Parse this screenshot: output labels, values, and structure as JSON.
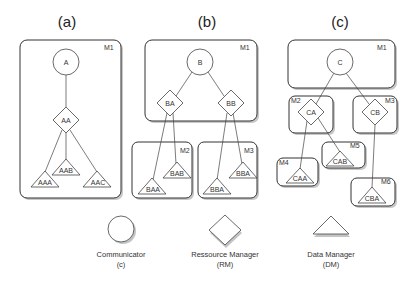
{
  "panels": [
    {
      "id": "a",
      "label": "(a)",
      "machines": [
        {
          "id": "M1",
          "label": "M1"
        }
      ],
      "nodes": [
        {
          "id": "A",
          "type": "communicator",
          "label": "A"
        },
        {
          "id": "AA",
          "type": "resource_manager",
          "label": "AA"
        },
        {
          "id": "AAA",
          "type": "data_manager",
          "label": "AAA"
        },
        {
          "id": "AAB",
          "type": "data_manager",
          "label": "AAB"
        },
        {
          "id": "AAC",
          "type": "data_manager",
          "label": "AAC"
        }
      ],
      "edges": [
        [
          "A",
          "AA"
        ],
        [
          "AA",
          "AAA"
        ],
        [
          "AA",
          "AAB"
        ],
        [
          "AA",
          "AAC"
        ]
      ]
    },
    {
      "id": "b",
      "label": "(b)",
      "machines": [
        {
          "id": "M1",
          "label": "M1"
        },
        {
          "id": "M2",
          "label": "M2"
        },
        {
          "id": "M3",
          "label": "M3"
        }
      ],
      "nodes": [
        {
          "id": "B",
          "type": "communicator",
          "label": "B"
        },
        {
          "id": "BA",
          "type": "resource_manager",
          "label": "BA"
        },
        {
          "id": "BB",
          "type": "resource_manager",
          "label": "BB"
        },
        {
          "id": "BAA",
          "type": "data_manager",
          "label": "BAA"
        },
        {
          "id": "BAB",
          "type": "data_manager",
          "label": "BAB"
        },
        {
          "id": "BBA_1",
          "type": "data_manager",
          "label": "BBA"
        },
        {
          "id": "BBA_2",
          "type": "data_manager",
          "label": "BBA"
        }
      ],
      "edges": [
        [
          "B",
          "BA"
        ],
        [
          "B",
          "BB"
        ],
        [
          "BA",
          "BAA"
        ],
        [
          "BA",
          "BAB"
        ],
        [
          "BB",
          "BBA_1"
        ],
        [
          "BB",
          "BBA_2"
        ]
      ]
    },
    {
      "id": "c",
      "label": "(c)",
      "machines": [
        {
          "id": "M1",
          "label": "M1"
        },
        {
          "id": "M2",
          "label": "M2"
        },
        {
          "id": "M3",
          "label": "M3"
        },
        {
          "id": "M4",
          "label": "M4"
        },
        {
          "id": "M5",
          "label": "M5"
        },
        {
          "id": "M6",
          "label": "M6"
        }
      ],
      "nodes": [
        {
          "id": "C",
          "type": "communicator",
          "label": "C"
        },
        {
          "id": "CA",
          "type": "resource_manager",
          "label": "CA"
        },
        {
          "id": "CB",
          "type": "resource_manager",
          "label": "CB"
        },
        {
          "id": "CAA",
          "type": "data_manager",
          "label": "CAA"
        },
        {
          "id": "CAB",
          "type": "data_manager",
          "label": "CAB"
        },
        {
          "id": "CBA",
          "type": "data_manager",
          "label": "CBA"
        }
      ],
      "edges": [
        [
          "C",
          "CA"
        ],
        [
          "C",
          "CB"
        ],
        [
          "CA",
          "CAA"
        ],
        [
          "CA",
          "CAB"
        ],
        [
          "CB",
          "CBA"
        ]
      ]
    }
  ],
  "legend": [
    {
      "shape": "circle",
      "name": "Communicator",
      "abbr": "(c)"
    },
    {
      "shape": "diamond",
      "name": "Ressource Manager",
      "abbr": "(RM)"
    },
    {
      "shape": "triangle",
      "name": "Data Manager",
      "abbr": "(DM)"
    }
  ]
}
